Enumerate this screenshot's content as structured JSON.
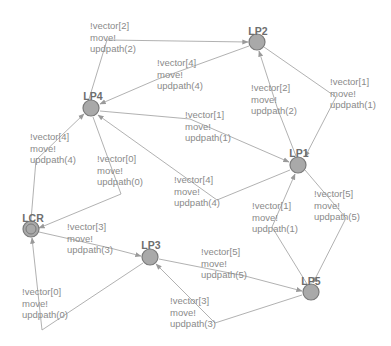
{
  "diagram": {
    "type": "state-machine",
    "colors": {
      "edge": "#a8a8a8",
      "node_fill": "#a9a9a9",
      "node_stroke": "#7a7a7a",
      "node_label": "#6e6e6e",
      "edge_label": "#8a8a8a"
    },
    "nodes": [
      {
        "id": "LP2",
        "label": "LP2",
        "x": 257,
        "y": 42,
        "initial": false
      },
      {
        "id": "LP4",
        "label": "LP4",
        "x": 91,
        "y": 108,
        "initial": false
      },
      {
        "id": "LP1",
        "label": "LP1",
        "x": 298,
        "y": 165,
        "initial": false
      },
      {
        "id": "LCR",
        "label": "LCR",
        "x": 31,
        "y": 229,
        "initial": true
      },
      {
        "id": "LP3",
        "label": "LP3",
        "x": 150,
        "y": 257,
        "initial": false
      },
      {
        "id": "LP5",
        "label": "LP5",
        "x": 311,
        "y": 292,
        "initial": false
      }
    ],
    "edges": [
      {
        "from": "LP4",
        "to": "LP2",
        "lines": [
          "!vector[2]",
          "move!",
          "updpath(2)"
        ]
      },
      {
        "from": "LP2",
        "to": "LP4",
        "lines": [
          "!vector[4]",
          "move!",
          "updpath(4)"
        ]
      },
      {
        "from": "LP1",
        "to": "LP2",
        "lines": [
          "!vector[2]",
          "move!",
          "updpath(2)"
        ]
      },
      {
        "from": "LP2",
        "to": "LP1",
        "lines": [
          "!vector[1]",
          "move!",
          "updpath(1)"
        ]
      },
      {
        "from": "LP4",
        "to": "LP1",
        "lines": [
          "!vector[1]",
          "move!",
          "updpath(1)"
        ]
      },
      {
        "from": "LP1",
        "to": "LP4",
        "lines": [
          "!vector[4]",
          "move!",
          "updpath(4)"
        ]
      },
      {
        "from": "LCR",
        "to": "LP4",
        "lines": [
          "!vector[4]",
          "move!",
          "updpath(4)"
        ]
      },
      {
        "from": "LP4",
        "to": "LCR",
        "lines": [
          "!vector[0]",
          "move!",
          "updpath(0)"
        ]
      },
      {
        "from": "LCR",
        "to": "LP3",
        "lines": [
          "!vector[3]",
          "move!",
          "updpath(3)"
        ]
      },
      {
        "from": "LP3",
        "to": "LCR",
        "lines": [
          "!vector[0]",
          "move!",
          "updpath(0)"
        ]
      },
      {
        "from": "LP3",
        "to": "LP5",
        "lines": [
          "!vector[5]",
          "move!",
          "updpath(5)"
        ]
      },
      {
        "from": "LP5",
        "to": "LP3",
        "lines": [
          "!vector[3]",
          "move!",
          "updpath(3)"
        ]
      },
      {
        "from": "LP5",
        "to": "LP1",
        "lines": [
          "!vector[1]",
          "move!",
          "updpath(1)"
        ]
      },
      {
        "from": "LP1",
        "to": "LP5",
        "lines": [
          "!vector[5]",
          "move!",
          "updpath(5)"
        ]
      }
    ]
  }
}
